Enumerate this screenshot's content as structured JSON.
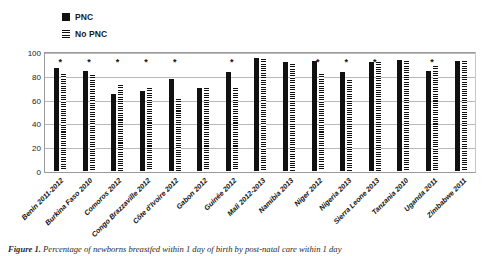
{
  "chart_data": {
    "type": "bar",
    "title": "",
    "xlabel": "",
    "ylabel": "",
    "ylim": [
      0,
      100
    ],
    "yticks": [
      0,
      20,
      40,
      60,
      80,
      100
    ],
    "grid": true,
    "legend_position": "top-left",
    "categories": [
      "Benin 2011-2012",
      "Burkina Faso 2010",
      "Comoros 2012",
      "Congo Brazzaville 2012",
      "Côte d'Ivoire 2012",
      "Gabon 2012",
      "Guinée 2012",
      "Mali 2012-2013",
      "Namibia 2013",
      "Niger 2012",
      "Nigeria 2013",
      "Sierra Leone 2013",
      "Tanzania 2010",
      "Uganda 2011",
      "Zimbabwe 2011"
    ],
    "series": [
      {
        "name": "PNC",
        "marker": "solid-black-square",
        "values": [
          87,
          85,
          65,
          68,
          78,
          70,
          84,
          96,
          92,
          93,
          84,
          92,
          94,
          85,
          93
        ]
      },
      {
        "name": "No PNC",
        "marker": "horizontal-hatch",
        "values": [
          82,
          81,
          73,
          70,
          61,
          70,
          70,
          95,
          91,
          82,
          77,
          92,
          93,
          89,
          93
        ]
      }
    ],
    "annotations": {
      "symbol": "*",
      "meaning": "statistically-significant-difference",
      "on_categories": [
        "Benin 2011-2012",
        "Burkina Faso 2010",
        "Comoros 2012",
        "Congo Brazzaville 2012",
        "Côte d'Ivoire 2012",
        "Guinée 2012",
        "Niger 2012",
        "Nigeria 2013",
        "Sierra Leone 2013",
        "Uganda 2011"
      ]
    }
  },
  "legend": {
    "items": [
      {
        "label": "PNC",
        "swatch": "solid"
      },
      {
        "label": "No PNC",
        "swatch": "hatch"
      }
    ]
  },
  "caption": {
    "figure_number": "Figure 1.",
    "text": "Percentage of newborns breastfed within 1 day of birth by post-natal care within 1 day"
  }
}
